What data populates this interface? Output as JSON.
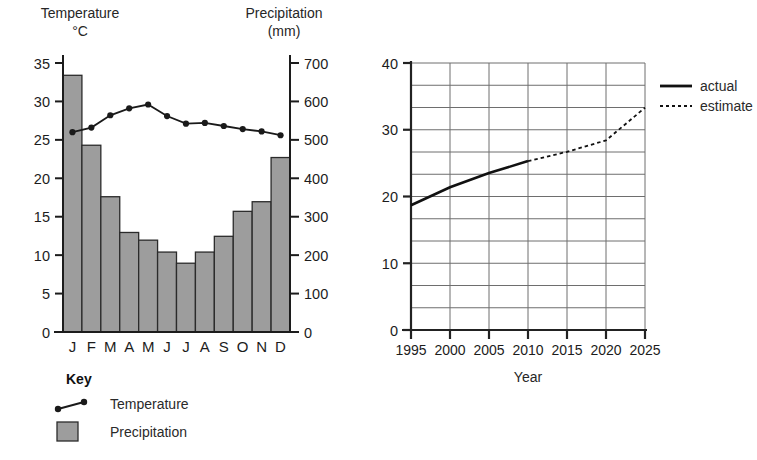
{
  "page": {
    "background": "#ffffff",
    "ink": "#1c1c1c"
  },
  "climate_chart": {
    "left_axis_title_line1": "Temperature",
    "left_axis_title_line2": "°C",
    "right_axis_title_line1": "Precipitation",
    "right_axis_title_line2": "(mm)",
    "left_ticks": [
      "0",
      "5",
      "10",
      "15",
      "20",
      "25",
      "30",
      "35"
    ],
    "right_ticks": [
      "0",
      "100",
      "200",
      "300",
      "400",
      "500",
      "600",
      "700"
    ],
    "month_labels": [
      "J",
      "F",
      "M",
      "A",
      "M",
      "J",
      "J",
      "A",
      "S",
      "O",
      "N",
      "D"
    ],
    "bar_color": "#9d9d9d",
    "bar_stroke": "#2b2b2b",
    "line_color": "#1a1a1a",
    "key": {
      "title": "Key",
      "temperature_label": "Temperature",
      "precipitation_label": "Precipitation"
    }
  },
  "trend_chart": {
    "x_axis_title": "Year",
    "y_ticks": [
      "0",
      "10",
      "20",
      "30",
      "40"
    ],
    "x_ticks": [
      "1995",
      "2000",
      "2005",
      "2010",
      "2015",
      "2020",
      "2025"
    ],
    "grid_color": "#6e6e6e",
    "axis_color": "#222222",
    "line_color": "#111111",
    "legend": {
      "actual_label": "actual",
      "estimate_label": "estimate"
    }
  },
  "chart_data": [
    {
      "type": "bar",
      "id": "climate-graph",
      "title": "",
      "xlabel": "",
      "ylabel": "Precipitation",
      "ylabel_secondary": "Temperature °C",
      "grid": false,
      "legend": "below-left",
      "categories": [
        "J",
        "F",
        "M",
        "A",
        "M",
        "J",
        "J",
        "A",
        "S",
        "O",
        "N",
        "D"
      ],
      "ylim": [
        0,
        750
      ],
      "ylim_secondary": [
        0,
        37.5
      ],
      "series": [
        {
          "name": "Precipitation",
          "unit": "mm",
          "axis": "right",
          "type": "bar",
          "values": [
            668,
            486,
            352,
            259,
            239,
            208,
            179,
            208,
            249,
            314,
            339,
            454
          ]
        },
        {
          "name": "Temperature",
          "unit": "°C",
          "axis": "left",
          "type": "line",
          "values": [
            26.0,
            26.6,
            28.2,
            29.1,
            29.6,
            28.1,
            27.1,
            27.2,
            26.8,
            26.4,
            26.1,
            25.6
          ]
        }
      ]
    },
    {
      "type": "line",
      "id": "year-trend-graph",
      "title": "",
      "xlabel": "Year",
      "ylabel": "",
      "grid": true,
      "legend": "right",
      "xlim": [
        1995,
        2025
      ],
      "ylim": [
        0,
        40
      ],
      "x": [
        1995,
        2000,
        2005,
        2010,
        2015,
        2020,
        2025
      ],
      "series": [
        {
          "name": "actual",
          "style": "solid",
          "x": [
            1995,
            2000,
            2005,
            2010
          ],
          "values": [
            18.7,
            21.4,
            23.5,
            25.3
          ]
        },
        {
          "name": "estimate",
          "style": "dotted",
          "x": [
            2010,
            2015,
            2020,
            2025
          ],
          "values": [
            25.3,
            26.7,
            28.4,
            33.3
          ]
        }
      ]
    }
  ]
}
